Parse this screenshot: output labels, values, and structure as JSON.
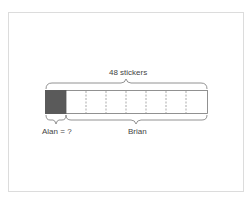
{
  "diagram": {
    "type": "tape-diagram",
    "total_label": "48 stickers",
    "segments_total": 8,
    "shaded_segments": 1,
    "shaded_color": "#5a5a5a",
    "alan_label": "Alan = ?",
    "brian_label": "Brian"
  }
}
